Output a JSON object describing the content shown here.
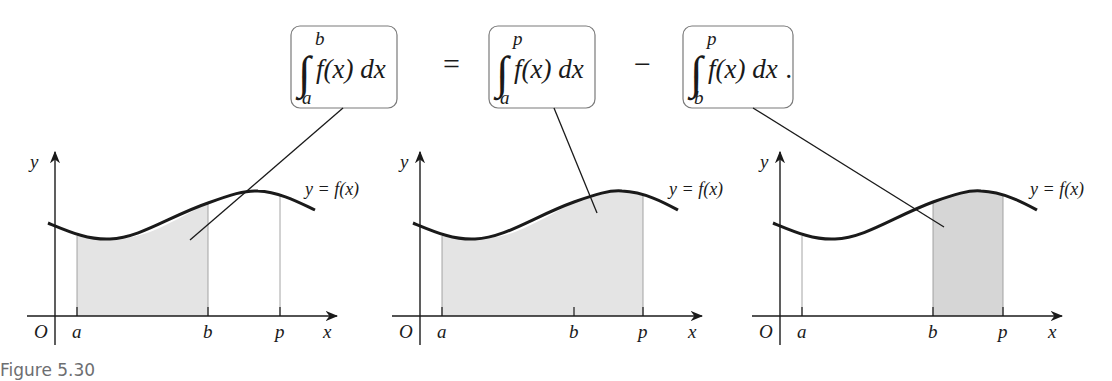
{
  "equation": {
    "terms": [
      {
        "integral_sign": "∫",
        "upper": "b",
        "lower": "a",
        "integrand": "f(x) dx",
        "trailing": ""
      },
      {
        "integral_sign": "∫",
        "upper": "p",
        "lower": "a",
        "integrand": "f(x) dx",
        "trailing": ""
      },
      {
        "integral_sign": "∫",
        "upper": "p",
        "lower": "b",
        "integrand": "f(x) dx",
        "trailing": "."
      }
    ],
    "operators": [
      "=",
      "−"
    ]
  },
  "panels": [
    {
      "shaded_from": "a",
      "shaded_to": "b",
      "axis_labels": {
        "y": "y",
        "x": "x",
        "origin": "O"
      },
      "ticks": [
        "a",
        "b",
        "p"
      ],
      "curve_label": "y = f(x)"
    },
    {
      "shaded_from": "a",
      "shaded_to": "p",
      "axis_labels": {
        "y": "y",
        "x": "x",
        "origin": "O"
      },
      "ticks": [
        "a",
        "b",
        "p"
      ],
      "curve_label": "y = f(x)"
    },
    {
      "shaded_from": "b",
      "shaded_to": "p",
      "axis_labels": {
        "y": "y",
        "x": "x",
        "origin": "O"
      },
      "ticks": [
        "a",
        "b",
        "p"
      ],
      "curve_label": "y = f(x)"
    }
  ],
  "caption": "Figure 5.30",
  "colors": {
    "shade": "#e4e4e4",
    "box_border": "#7a7a7a",
    "caption": "#6d6e71",
    "ink": "#1a1a1a"
  }
}
